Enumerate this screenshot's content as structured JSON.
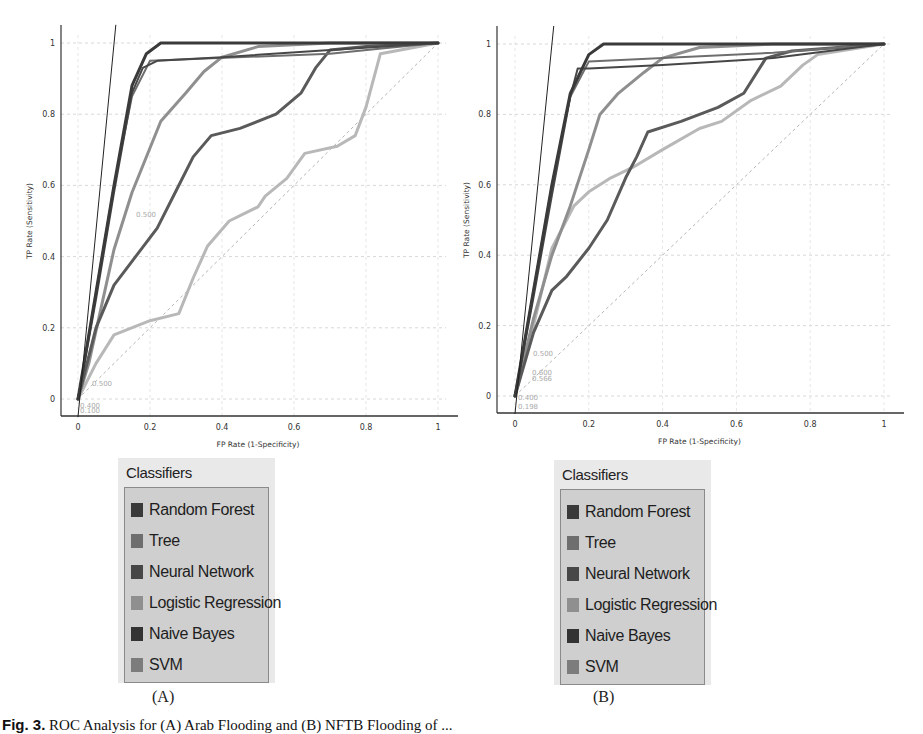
{
  "figure": {
    "caption_prefix": "Fig. 3.",
    "caption_text": "ROC Analysis for (A) Arab Flooding and (B) NFTB Flooding of ..."
  },
  "panels": [
    {
      "id": "A",
      "label": "(A)"
    },
    {
      "id": "B",
      "label": "(B)"
    }
  ],
  "legend": {
    "title": "Classifiers",
    "items": [
      {
        "label": "Random Forest",
        "color": "#3a3a3a"
      },
      {
        "label": "Tree",
        "color": "#6e6e6e"
      },
      {
        "label": "Neural Network",
        "color": "#474747"
      },
      {
        "label": "Logistic Regression",
        "color": "#8f8f8f"
      },
      {
        "label": "Naive Bayes",
        "color": "#333333"
      },
      {
        "label": "SVM",
        "color": "#7c7c7c"
      }
    ]
  },
  "chart_data": [
    {
      "type": "line",
      "title": "(A)",
      "xlabel": "FP Rate (1-Specificity)",
      "ylabel": "TP Rate (Sensitivity)",
      "xlim": [
        0,
        1
      ],
      "ylim": [
        0,
        1
      ],
      "xticks": [
        "0",
        "0.2",
        "0.4",
        "0.6",
        "0.8",
        "1"
      ],
      "yticks": [
        "0",
        "0.2",
        "0.4",
        "0.6",
        "0.8",
        "1"
      ],
      "grid": true,
      "diagonal": true,
      "annotations": [
        "0.500",
        "0.500",
        "0.400",
        "0.100"
      ],
      "series": [
        {
          "name": "Random Forest",
          "color": "#3a3a3a",
          "x": [
            0,
            0.05,
            0.1,
            0.15,
            0.19,
            0.23,
            0.4,
            0.7,
            1
          ],
          "y": [
            0,
            0.3,
            0.6,
            0.88,
            0.97,
            1.0,
            1.0,
            1.0,
            1.0
          ]
        },
        {
          "name": "Tree",
          "color": "#6e6e6e",
          "x": [
            0,
            0.05,
            0.1,
            0.15,
            0.2,
            0.7,
            0.85,
            1
          ],
          "y": [
            0,
            0.3,
            0.6,
            0.85,
            0.95,
            0.97,
            0.985,
            1.0
          ]
        },
        {
          "name": "Neural Network",
          "color": "#474747",
          "x": [
            0,
            0.05,
            0.1,
            0.15,
            0.18,
            0.22,
            0.4,
            0.7,
            1
          ],
          "y": [
            0,
            0.28,
            0.58,
            0.86,
            0.93,
            0.95,
            0.96,
            0.98,
            1.0
          ]
        },
        {
          "name": "Logistic Regression",
          "color": "#8f8f8f",
          "x": [
            0,
            0.03,
            0.1,
            0.15,
            0.23,
            0.3,
            0.35,
            0.4,
            0.5,
            0.7,
            1
          ],
          "y": [
            0,
            0.1,
            0.42,
            0.58,
            0.78,
            0.86,
            0.92,
            0.96,
            0.99,
            1.0,
            1.0
          ]
        },
        {
          "name": "Naive Bayes",
          "color": "#5a5a5a",
          "x": [
            0,
            0.05,
            0.1,
            0.16,
            0.22,
            0.27,
            0.32,
            0.37,
            0.45,
            0.55,
            0.62,
            0.66,
            0.7,
            0.8,
            1
          ],
          "y": [
            0,
            0.2,
            0.32,
            0.4,
            0.48,
            0.58,
            0.68,
            0.74,
            0.76,
            0.8,
            0.86,
            0.93,
            0.98,
            0.99,
            1.0
          ]
        },
        {
          "name": "SVM",
          "color": "#b8b8b8",
          "x": [
            0,
            0.05,
            0.1,
            0.2,
            0.28,
            0.32,
            0.36,
            0.42,
            0.5,
            0.52,
            0.58,
            0.63,
            0.72,
            0.77,
            0.8,
            0.84,
            1
          ],
          "y": [
            0,
            0.1,
            0.18,
            0.22,
            0.24,
            0.34,
            0.43,
            0.5,
            0.54,
            0.57,
            0.62,
            0.69,
            0.71,
            0.74,
            0.82,
            0.97,
            1.0
          ]
        },
        {
          "name": "Reference (steep)",
          "color": "#222222",
          "x": [
            0,
            0.105
          ],
          "y": [
            -0.05,
            1.05
          ]
        }
      ]
    },
    {
      "type": "line",
      "title": "(B)",
      "xlabel": "FP Rate (1-Specificity)",
      "ylabel": "TP Rate (Sensitivity)",
      "xlim": [
        0,
        1
      ],
      "ylim": [
        0,
        1
      ],
      "xticks": [
        "0",
        "0.2",
        "0.4",
        "0.6",
        "0.8",
        "1"
      ],
      "yticks": [
        "0",
        "0.2",
        "0.4",
        "0.6",
        "0.8",
        "1"
      ],
      "grid": true,
      "diagonal": true,
      "annotations": [
        "0.500",
        "0.600",
        "0.566",
        "0.400",
        "0.198"
      ],
      "series": [
        {
          "name": "Random Forest",
          "color": "#3a3a3a",
          "x": [
            0,
            0.05,
            0.1,
            0.15,
            0.2,
            0.24,
            0.4,
            0.7,
            1
          ],
          "y": [
            0,
            0.3,
            0.6,
            0.86,
            0.97,
            1.0,
            1.0,
            1.0,
            1.0
          ]
        },
        {
          "name": "Tree",
          "color": "#6e6e6e",
          "x": [
            0,
            0.05,
            0.1,
            0.15,
            0.2,
            0.7,
            0.82,
            1
          ],
          "y": [
            0,
            0.3,
            0.6,
            0.85,
            0.95,
            0.975,
            0.985,
            1.0
          ]
        },
        {
          "name": "Neural Network",
          "color": "#474747",
          "x": [
            0,
            0.05,
            0.1,
            0.15,
            0.17,
            0.2,
            0.4,
            0.7,
            1
          ],
          "y": [
            0,
            0.28,
            0.57,
            0.85,
            0.93,
            0.93,
            0.94,
            0.96,
            1.0
          ]
        },
        {
          "name": "Logistic Regression",
          "color": "#8f8f8f",
          "x": [
            0,
            0.05,
            0.1,
            0.15,
            0.2,
            0.23,
            0.28,
            0.35,
            0.4,
            0.5,
            0.7,
            1
          ],
          "y": [
            0,
            0.22,
            0.4,
            0.54,
            0.7,
            0.8,
            0.86,
            0.92,
            0.96,
            0.99,
            1.0,
            1.0
          ]
        },
        {
          "name": "Naive Bayes",
          "color": "#5a5a5a",
          "x": [
            0,
            0.05,
            0.1,
            0.14,
            0.2,
            0.25,
            0.3,
            0.33,
            0.36,
            0.45,
            0.55,
            0.62,
            0.68,
            0.75,
            1
          ],
          "y": [
            0,
            0.18,
            0.3,
            0.34,
            0.42,
            0.5,
            0.62,
            0.68,
            0.75,
            0.78,
            0.82,
            0.86,
            0.96,
            0.98,
            1.0
          ]
        },
        {
          "name": "SVM",
          "color": "#b8b8b8",
          "x": [
            0,
            0.05,
            0.1,
            0.16,
            0.2,
            0.26,
            0.32,
            0.4,
            0.5,
            0.56,
            0.64,
            0.72,
            0.78,
            0.82,
            1
          ],
          "y": [
            0,
            0.2,
            0.42,
            0.54,
            0.58,
            0.62,
            0.65,
            0.7,
            0.76,
            0.78,
            0.84,
            0.88,
            0.94,
            0.97,
            1.0
          ]
        },
        {
          "name": "Reference (steep)",
          "color": "#222222",
          "x": [
            0,
            0.105
          ],
          "y": [
            -0.05,
            1.05
          ]
        }
      ]
    }
  ]
}
